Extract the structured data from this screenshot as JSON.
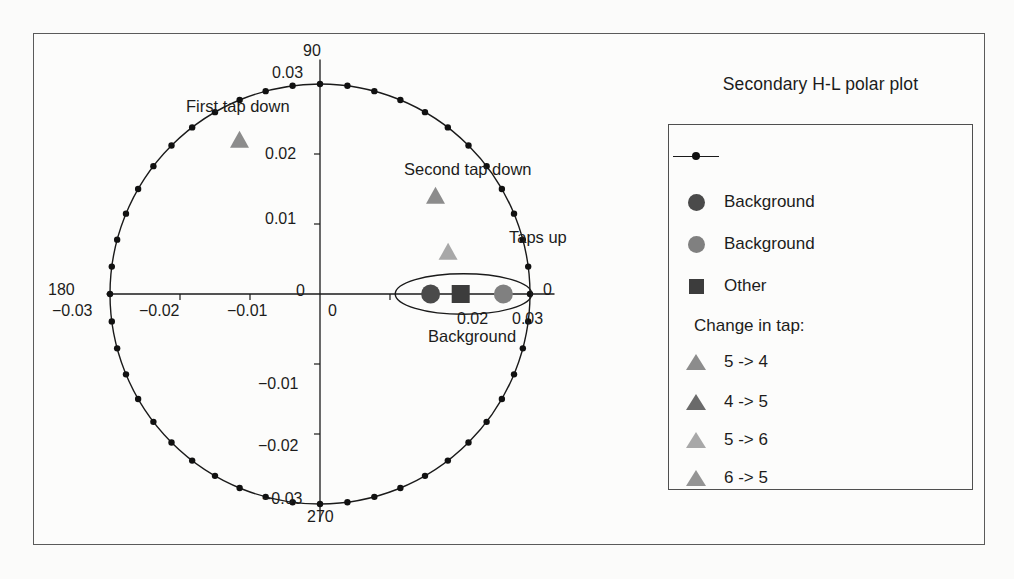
{
  "figure": {
    "background_color": "#fbfbfa",
    "frame_color": "#5a5a5a"
  },
  "legend": {
    "title": "Secondary H-L polar plot",
    "entries": [
      {
        "marker": "line-with-dot-marker",
        "label": "",
        "color": "#1a1a1a"
      },
      {
        "marker": "circle-marker",
        "label": "Background",
        "color": "#4a4a4a"
      },
      {
        "marker": "circle-marker",
        "label": "Background",
        "color": "#808080"
      },
      {
        "marker": "square-marker",
        "label": "Other",
        "color": "#3c3c3c"
      }
    ],
    "group_heading": "Change in tap:",
    "tap_entries": [
      {
        "marker": "triangle-marker",
        "label": "5 -> 4",
        "color": "#8c8c8c"
      },
      {
        "marker": "triangle-marker",
        "label": "4 -> 5",
        "color": "#6a6a6a"
      },
      {
        "marker": "triangle-marker",
        "label": "5 -> 6",
        "color": "#a8a8a8"
      },
      {
        "marker": "triangle-marker",
        "label": "6 -> 5",
        "color": "#949494"
      }
    ]
  },
  "chart_data": {
    "type": "scatter",
    "title": "Secondary H-L polar plot",
    "xlabel": "",
    "ylabel": "",
    "grid": false,
    "legend_position": "right",
    "xlim": [
      -0.035,
      0.035
    ],
    "ylim": [
      -0.035,
      0.035
    ],
    "x_ticks": [
      -0.03,
      -0.02,
      -0.01,
      0
    ],
    "x_tick_labels": [
      "−0.03",
      "−0.02",
      "−0.01",
      "0"
    ],
    "y_ticks": [
      0.02,
      0.01,
      0,
      -0.01,
      -0.02
    ],
    "y_tick_labels": [
      "0.02",
      "0.01",
      "0",
      "−0.01",
      "−0.02"
    ],
    "polar_angle_labels": [
      {
        "text": "90",
        "angle_deg": 90,
        "radius_label": "0.03"
      },
      {
        "text": "180",
        "angle_deg": 180,
        "radius_label": "−0.03"
      },
      {
        "text": "270",
        "angle_deg": 270,
        "radius_label": "−0.03"
      },
      {
        "text": "0",
        "angle_deg": 0,
        "radius_label": "0.03"
      }
    ],
    "unit_circle": {
      "radius": 0.03,
      "marker": "small-black-dot",
      "n_markers": 48,
      "line_color": "#1a1a1a"
    },
    "points": [
      {
        "name": "First tap down",
        "marker": "triangle",
        "color": "#8c8c8c",
        "x": -0.0115,
        "y": 0.0218,
        "label": "First tap down"
      },
      {
        "name": "Second tap down",
        "marker": "triangle",
        "color": "#8c8c8c",
        "x": 0.0165,
        "y": 0.0138,
        "label": "Second tap down"
      },
      {
        "name": "Taps up",
        "marker": "triangle",
        "color": "#a8a8a8",
        "x": 0.0183,
        "y": 0.0058,
        "label": "Taps up"
      },
      {
        "name": "Background dark",
        "marker": "circle",
        "color": "#4a4a4a",
        "x": 0.0158,
        "y": 0.0
      },
      {
        "name": "Other square",
        "marker": "square",
        "color": "#3c3c3c",
        "x": 0.0201,
        "y": 0.0
      },
      {
        "name": "Background medium",
        "marker": "circle",
        "color": "#808080",
        "x": 0.0262,
        "y": 0.0
      }
    ],
    "cluster_annotation": {
      "label": "Background",
      "shape": "ellipse",
      "center_x": 0.0205,
      "center_y": 0.0,
      "width": 0.0195,
      "height": 0.0058
    }
  }
}
